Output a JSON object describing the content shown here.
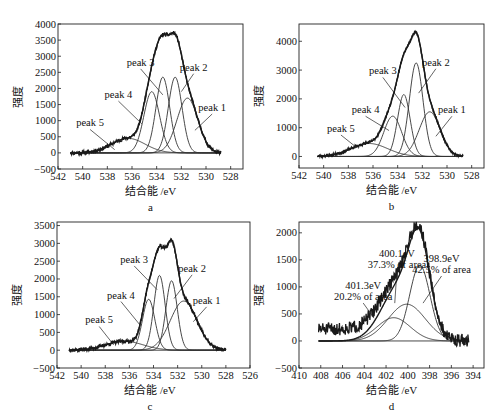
{
  "figure": {
    "y_axis_title": "强度",
    "x_axis_title": "结合能 /eV"
  },
  "chart_data": [
    {
      "panel": "a",
      "type": "line",
      "title": "",
      "xlabel": "结合能 /eV",
      "ylabel": "强度",
      "xlim": [
        542,
        527
      ],
      "ylim": [
        -500,
        4000
      ],
      "xticks": [
        542,
        540,
        538,
        536,
        534,
        532,
        530,
        528
      ],
      "yticks": [
        -500,
        0,
        500,
        1000,
        1500,
        2000,
        2500,
        3000,
        3500,
        4000
      ],
      "grid": false,
      "data_range": [
        541,
        528.8
      ],
      "peaks": [
        {
          "name": "peak 1",
          "center": 531.5,
          "height": 1700,
          "fwhm": 2.0
        },
        {
          "name": "peak 2",
          "center": 532.5,
          "height": 2350,
          "fwhm": 1.3
        },
        {
          "name": "peak 3",
          "center": 533.5,
          "height": 2350,
          "fwhm": 1.3
        },
        {
          "name": "peak 4",
          "center": 534.4,
          "height": 1900,
          "fwhm": 1.5
        },
        {
          "name": "peak 5",
          "center": 536.3,
          "height": 450,
          "fwhm": 3.2
        }
      ],
      "annotations": [
        {
          "text": "peak 1",
          "x": 529.5,
          "y": 1300,
          "ax": 530.9,
          "ay": 700
        },
        {
          "text": "peak 2",
          "x": 531.0,
          "y": 2550,
          "ax": 532.0,
          "ay": 1900
        },
        {
          "text": "peak 3",
          "x": 535.3,
          "y": 2700,
          "ax": 533.5,
          "ay": 1800
        },
        {
          "text": "peak 4",
          "x": 537.1,
          "y": 1700,
          "ax": 535.2,
          "ay": 900
        },
        {
          "text": "peak 5",
          "x": 539.4,
          "y": 820,
          "ax": 537.4,
          "ay": 100
        }
      ],
      "noise": 60,
      "seed": 11,
      "tail": 150
    },
    {
      "panel": "b",
      "type": "line",
      "title": "",
      "xlabel": "结合能 /eV",
      "ylabel": "强度",
      "xlim": [
        542,
        527
      ],
      "ylim": [
        -400,
        4600
      ],
      "xticks": [
        542,
        540,
        538,
        536,
        534,
        532,
        530,
        528
      ],
      "yticks": [
        0,
        1000,
        2000,
        3000,
        4000
      ],
      "grid": false,
      "data_range": [
        540.5,
        528.7
      ],
      "peaks": [
        {
          "name": "peak 1",
          "center": 531.4,
          "height": 1550,
          "fwhm": 2.0
        },
        {
          "name": "peak 2",
          "center": 532.5,
          "height": 3250,
          "fwhm": 1.3
        },
        {
          "name": "peak 3",
          "center": 533.5,
          "height": 2150,
          "fwhm": 1.2
        },
        {
          "name": "peak 4",
          "center": 534.4,
          "height": 1400,
          "fwhm": 1.7
        },
        {
          "name": "peak 5",
          "center": 536.3,
          "height": 450,
          "fwhm": 3.5
        }
      ],
      "annotations": [
        {
          "text": "peak 1",
          "x": 529.6,
          "y": 1500,
          "ax": 530.9,
          "ay": 700
        },
        {
          "text": "peak 2",
          "x": 530.9,
          "y": 3150,
          "ax": 532.3,
          "ay": 2200
        },
        {
          "text": "peak 3",
          "x": 535.2,
          "y": 2850,
          "ax": 533.4,
          "ay": 1700
        },
        {
          "text": "peak 4",
          "x": 536.6,
          "y": 1500,
          "ax": 534.7,
          "ay": 900
        },
        {
          "text": "peak 5",
          "x": 538.6,
          "y": 850,
          "ax": 537.3,
          "ay": 300
        }
      ],
      "noise": 50,
      "seed": 23,
      "tail": 120
    },
    {
      "panel": "c",
      "type": "line",
      "title": "",
      "xlabel": "结合能 /eV",
      "ylabel": "强度",
      "xlim": [
        542,
        526
      ],
      "ylim": [
        -500,
        3600
      ],
      "xticks": [
        542,
        540,
        538,
        536,
        534,
        532,
        530,
        528,
        526
      ],
      "yticks": [
        -500,
        0,
        500,
        1000,
        1500,
        2000,
        2500,
        3000,
        3500
      ],
      "grid": false,
      "data_range": [
        541,
        528
      ],
      "peaks": [
        {
          "name": "peak 1",
          "center": 531.5,
          "height": 1380,
          "fwhm": 2.6
        },
        {
          "name": "peak 2",
          "center": 532.5,
          "height": 1950,
          "fwhm": 1.1
        },
        {
          "name": "peak 3",
          "center": 533.5,
          "height": 2100,
          "fwhm": 1.1
        },
        {
          "name": "peak 4",
          "center": 534.4,
          "height": 1430,
          "fwhm": 1.2
        },
        {
          "name": "peak 5",
          "center": 536.4,
          "height": 250,
          "fwhm": 3.6
        }
      ],
      "annotations": [
        {
          "text": "peak 1",
          "x": 529.6,
          "y": 1300,
          "ax": 530.7,
          "ay": 800
        },
        {
          "text": "peak 2",
          "x": 530.8,
          "y": 2200,
          "ax": 532.3,
          "ay": 1450
        },
        {
          "text": "peak 3",
          "x": 535.6,
          "y": 2450,
          "ax": 533.7,
          "ay": 1700
        },
        {
          "text": "peak 4",
          "x": 536.7,
          "y": 1450,
          "ax": 535.1,
          "ay": 700
        },
        {
          "text": "peak 5",
          "x": 538.5,
          "y": 750,
          "ax": 537.3,
          "ay": 150
        }
      ],
      "noise": 55,
      "seed": 37,
      "tail": 80
    },
    {
      "panel": "d",
      "type": "line",
      "title": "",
      "xlabel": "结合能 /eV",
      "ylabel": "强度",
      "xlim": [
        410,
        393
      ],
      "ylim": [
        -500,
        2200
      ],
      "xticks": [
        410,
        408,
        406,
        404,
        402,
        400,
        398,
        396,
        394
      ],
      "yticks": [
        -500,
        0,
        500,
        1000,
        1500,
        2000
      ],
      "grid": false,
      "data_range": [
        408.2,
        394.4
      ],
      "peaks": [
        {
          "name": "398.9eV",
          "center": 398.9,
          "height": 1400,
          "fwhm": 2.2
        },
        {
          "name": "400.1eV",
          "center": 400.1,
          "height": 680,
          "fwhm": 4.0
        },
        {
          "name": "401.3eV",
          "center": 401.3,
          "height": 430,
          "fwhm": 3.6
        }
      ],
      "annotations": [
        {
          "text": "398.9eV",
          "text2": "42.5% of area",
          "x": 396.9,
          "y": 1460,
          "ax": 398.6,
          "ay": 700
        },
        {
          "text": "400.1eV",
          "text2": "37.3% of area",
          "x": 401.0,
          "y": 1560,
          "ax": 401.2,
          "ay": 700
        },
        {
          "text": "401.3eV",
          "text2": "20.2% of area",
          "x": 404.1,
          "y": 960,
          "ax": 403.1,
          "ay": 420
        }
      ],
      "noise": 120,
      "seed": 51,
      "tail": 220
    }
  ],
  "panels": {
    "a": {
      "label": "a"
    },
    "b": {
      "label": "b"
    },
    "c": {
      "label": "c"
    },
    "d": {
      "label": "d"
    }
  },
  "layout": {
    "frames": {
      "a": {
        "left": 58,
        "top": 24,
        "right": 243,
        "bottom": 169
      },
      "b": {
        "left": 299,
        "top": 24,
        "right": 484,
        "bottom": 168
      },
      "c": {
        "left": 57,
        "top": 222,
        "right": 250,
        "bottom": 368
      },
      "d": {
        "left": 299,
        "top": 222,
        "right": 484,
        "bottom": 368
      }
    },
    "line_color": "#1a1a1a",
    "fit_color": "#333333"
  }
}
